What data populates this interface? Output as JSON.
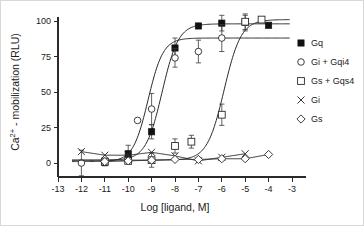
{
  "chart_data": {
    "type": "line",
    "title": "",
    "xlabel": "Log [ligand, M]",
    "ylabel": "Ca2+ - mobilization (RLU)",
    "ylabel_base": "Ca",
    "ylabel_sup": "2+",
    "ylabel_rest": " - mobilization (RLU)",
    "xlim": [
      -13,
      -3
    ],
    "ylim": [
      -8,
      108
    ],
    "xticks": [
      -13,
      -12,
      -11,
      -10,
      -9,
      -8,
      -7,
      -6,
      -5,
      -4,
      -3
    ],
    "xticklabels": [
      "-13",
      "-12",
      "-11",
      "-10",
      "-9",
      "-8",
      "-7",
      "-6",
      "-5",
      "-4",
      "-3"
    ],
    "yticks": [
      0,
      25,
      50,
      75,
      100
    ],
    "yticklabels": [
      "0",
      "25",
      "50",
      "75",
      "100"
    ],
    "grid": false,
    "legend_position": "right",
    "series": [
      {
        "name": "Gq",
        "marker": "filled-square",
        "ec50": -8.55,
        "top": 98,
        "bottom": 2,
        "hill": 1.25,
        "points": [
          {
            "x": -11,
            "y": 0.5,
            "err": 2.5
          },
          {
            "x": -10,
            "y": 6.5,
            "err": 6.0
          },
          {
            "x": -9,
            "y": 22.0,
            "err": 5.0
          },
          {
            "x": -8,
            "y": 81.0,
            "err": 7.0
          },
          {
            "x": -7,
            "y": 96.5,
            "err": 0
          },
          {
            "x": -6,
            "y": 98.5,
            "err": 5.5
          },
          {
            "x": -5,
            "y": 99.0,
            "err": 6.0
          },
          {
            "x": -4,
            "y": 97.0,
            "err": 0
          }
        ]
      },
      {
        "name": "Gi + Gqi4",
        "marker": "open-circle",
        "ec50": -9.15,
        "top": 88,
        "bottom": 1,
        "hill": 1.35,
        "points": [
          {
            "x": -12,
            "y": 0.0,
            "err": 9.0
          },
          {
            "x": -11,
            "y": 1.0,
            "err": 0
          },
          {
            "x": -10,
            "y": 1.5,
            "err": 0
          },
          {
            "x": -9.6,
            "y": 30.0,
            "err": 0
          },
          {
            "x": -9,
            "y": 38.0,
            "err": 11.0
          },
          {
            "x": -8,
            "y": 74.0,
            "err": 6.5
          },
          {
            "x": -7,
            "y": 78.5,
            "err": 8.0
          },
          {
            "x": -6,
            "y": 88.0,
            "err": 9.5
          },
          {
            "x": -5,
            "y": 99.0,
            "err": 5.0
          }
        ]
      },
      {
        "name": "Gs + Gqs4",
        "marker": "open-square",
        "ec50": -5.9,
        "top": 101,
        "bottom": 2,
        "hill": 1.2,
        "points": [
          {
            "x": -11,
            "y": 1.0,
            "err": 0
          },
          {
            "x": -10,
            "y": 1.5,
            "err": 0
          },
          {
            "x": -9,
            "y": 2.0,
            "err": 5.0
          },
          {
            "x": -8,
            "y": 12.0,
            "err": 5.0
          },
          {
            "x": -7.3,
            "y": 15.0,
            "err": 4.5
          },
          {
            "x": -6,
            "y": 34.0,
            "err": 7.5
          },
          {
            "x": -5,
            "y": 99.5,
            "err": 0
          },
          {
            "x": -4.3,
            "y": 101.0,
            "err": 0
          }
        ]
      },
      {
        "name": "Gi",
        "marker": "x-cross",
        "ec50": null,
        "top": 6,
        "bottom": 6,
        "hill": 0,
        "points": [
          {
            "x": -12,
            "y": 8.0,
            "err": 0
          },
          {
            "x": -11,
            "y": 5.5,
            "err": 0
          },
          {
            "x": -10,
            "y": 5.5,
            "err": 0
          },
          {
            "x": -9,
            "y": 7.5,
            "err": 0
          },
          {
            "x": -8,
            "y": 5.0,
            "err": 0
          },
          {
            "x": -7,
            "y": 1.5,
            "err": 0
          },
          {
            "x": -6,
            "y": 4.0,
            "err": 0
          },
          {
            "x": -5,
            "y": 6.5,
            "err": 0
          }
        ]
      },
      {
        "name": "Gs",
        "marker": "open-diamond",
        "ec50": null,
        "top": 3,
        "bottom": 3,
        "hill": 0,
        "points": [
          {
            "x": -11,
            "y": 1.0,
            "err": 0
          },
          {
            "x": -10,
            "y": 1.5,
            "err": 0
          },
          {
            "x": -9,
            "y": 2.0,
            "err": 0
          },
          {
            "x": -8,
            "y": 2.5,
            "err": 0
          },
          {
            "x": -7,
            "y": 2.5,
            "err": 0
          },
          {
            "x": -6,
            "y": 3.0,
            "err": 0
          },
          {
            "x": -5,
            "y": 3.0,
            "err": 0
          },
          {
            "x": -4,
            "y": 6.0,
            "err": 0
          }
        ]
      }
    ]
  },
  "legend": {
    "items": [
      {
        "label": "Gq",
        "marker": "filled-square"
      },
      {
        "label": "Gi + Gqi4",
        "marker": "open-circle"
      },
      {
        "label": "Gs + Gqs4",
        "marker": "open-square"
      },
      {
        "label": "Gi",
        "marker": "x-cross"
      },
      {
        "label": "Gs",
        "marker": "open-diamond"
      }
    ]
  },
  "colors": {
    "axis": "#2a2a2a",
    "marker_filled": "#111111",
    "marker_open_fill": "#ffffff",
    "curve": "#2a2a2a",
    "background": "#ffffff"
  }
}
